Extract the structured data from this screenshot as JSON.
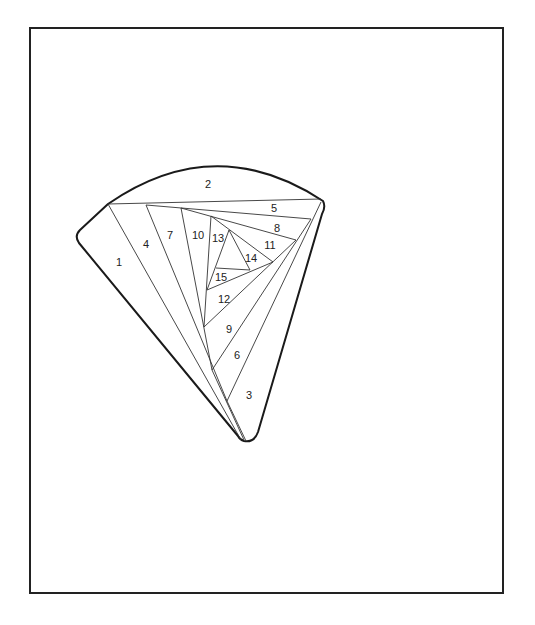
{
  "diagram": {
    "type": "iris-folding-pattern",
    "shape": "fan-wedge",
    "border": {
      "x": 30,
      "y": 28,
      "width": 473,
      "height": 565,
      "stroke": "#222222",
      "stroke_width": 2
    },
    "outline": {
      "stroke": "#1a1a1a",
      "stroke_width": 2
    },
    "line_color": "#333333",
    "segments": [
      {
        "id": "1",
        "label": "1",
        "x": 119,
        "y": 262
      },
      {
        "id": "2",
        "label": "2",
        "x": 208,
        "y": 184
      },
      {
        "id": "3",
        "label": "3",
        "x": 249,
        "y": 395
      },
      {
        "id": "4",
        "label": "4",
        "x": 146,
        "y": 244
      },
      {
        "id": "5",
        "label": "5",
        "x": 274,
        "y": 208
      },
      {
        "id": "6",
        "label": "6",
        "x": 237,
        "y": 355
      },
      {
        "id": "7",
        "label": "7",
        "x": 170,
        "y": 235
      },
      {
        "id": "8",
        "label": "8",
        "x": 277,
        "y": 228
      },
      {
        "id": "9",
        "label": "9",
        "x": 229,
        "y": 329
      },
      {
        "id": "10",
        "label": "10",
        "x": 198,
        "y": 235
      },
      {
        "id": "11",
        "label": "11",
        "x": 270,
        "y": 245
      },
      {
        "id": "12",
        "label": "12",
        "x": 224,
        "y": 299
      },
      {
        "id": "13",
        "label": "13",
        "x": 218,
        "y": 238
      },
      {
        "id": "14",
        "label": "14",
        "x": 251,
        "y": 258
      },
      {
        "id": "15",
        "label": "15",
        "x": 221,
        "y": 277
      }
    ]
  }
}
